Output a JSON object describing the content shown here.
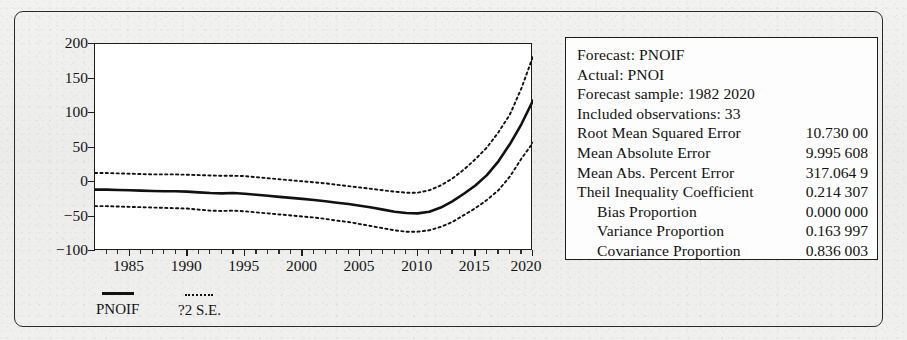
{
  "chart_data": {
    "type": "line",
    "title": "",
    "xlabel": "",
    "ylabel": "",
    "xlim": [
      1982,
      2020
    ],
    "ylim": [
      -100,
      200
    ],
    "ytick_labels": [
      "200",
      "150",
      "100",
      "50",
      "0",
      "−50",
      "−100"
    ],
    "yticks": [
      200,
      150,
      100,
      50,
      0,
      -50,
      -100
    ],
    "xtick_labels": [
      "1985",
      "1990",
      "1995",
      "2000",
      "2005",
      "2010",
      "2015",
      "2020"
    ],
    "xticks": [
      1985,
      1990,
      1995,
      2000,
      2005,
      2010,
      2015,
      2020
    ],
    "grid": false,
    "legend_position": "below-left",
    "x": [
      1982,
      1983,
      1984,
      1985,
      1986,
      1987,
      1988,
      1989,
      1990,
      1991,
      1992,
      1993,
      1994,
      1995,
      1996,
      1997,
      1998,
      1999,
      2000,
      2001,
      2002,
      2003,
      2004,
      2005,
      2006,
      2007,
      2008,
      2009,
      2010,
      2011,
      2012,
      2013,
      2014,
      2015,
      2016,
      2017,
      2018,
      2019,
      2020
    ],
    "series": [
      {
        "name": "PNOIF",
        "style": "solid",
        "values": [
          -11,
          -11,
          -11.5,
          -12,
          -12.5,
          -13,
          -13.5,
          -13.5,
          -14,
          -15,
          -16,
          -16.5,
          -16,
          -17,
          -18.5,
          -20,
          -21.5,
          -23,
          -24.5,
          -26,
          -28,
          -30,
          -32,
          -34.5,
          -37,
          -40,
          -43,
          -45,
          -45.5,
          -43,
          -37,
          -28,
          -17,
          -5,
          10,
          30,
          55,
          84,
          118
        ]
      },
      {
        "name": "+2 S.E.",
        "style": "dotted",
        "values": [
          13,
          13,
          12.5,
          12,
          11.5,
          11,
          11,
          11,
          10.5,
          10,
          9.5,
          9,
          9,
          8.5,
          7,
          5.5,
          4,
          2.5,
          1,
          -0.5,
          -2,
          -4,
          -6,
          -8,
          -10,
          -12,
          -14,
          -15.5,
          -15.5,
          -12,
          -5,
          5,
          18,
          33,
          50,
          72,
          98,
          136,
          182
        ]
      },
      {
        "name": "-2 S.E.",
        "style": "dotted",
        "values": [
          -35,
          -35,
          -35.5,
          -36,
          -36.5,
          -37,
          -37.5,
          -38,
          -38.5,
          -40,
          -41.5,
          -42,
          -41.5,
          -42.5,
          -44,
          -45.5,
          -47,
          -48.5,
          -50,
          -51.5,
          -53.5,
          -56,
          -58,
          -61,
          -64,
          -67,
          -70,
          -72,
          -72,
          -70,
          -65,
          -58,
          -48,
          -38,
          -26,
          -12,
          8,
          34,
          57
        ]
      }
    ],
    "legend": [
      {
        "label": "PNOIF",
        "style": "solid"
      },
      {
        "label": "?2 S.E.",
        "style": "dotted"
      }
    ]
  },
  "stats": {
    "rows": [
      {
        "label": "Forecast: PNOIF",
        "value": "",
        "indent": false
      },
      {
        "label": "Actual: PNOI",
        "value": "",
        "indent": false
      },
      {
        "label": "Forecast sample: 1982 2020",
        "value": "",
        "indent": false
      },
      {
        "label": "Included observations: 33",
        "value": "",
        "indent": false
      },
      {
        "label": "Root Mean Squared Error",
        "value": "10.730 00",
        "indent": false
      },
      {
        "label": "Mean Absolute Error",
        "value": "9.995 608",
        "indent": false
      },
      {
        "label": "Mean Abs. Percent Error",
        "value": "317.064 9",
        "indent": false
      },
      {
        "label": "Theil Inequality Coefficient",
        "value": "0.214 307",
        "indent": false
      },
      {
        "label": "Bias Proportion",
        "value": "0.000 000",
        "indent": true
      },
      {
        "label": "Variance Proportion",
        "value": "0.163 997",
        "indent": true
      },
      {
        "label": "Covariance Proportion",
        "value": "0.836 003",
        "indent": true
      }
    ]
  },
  "colors": {
    "line": "#111111",
    "axis": "#1d1d1d",
    "background": "#efefee",
    "plot_background": "#ffffff"
  }
}
